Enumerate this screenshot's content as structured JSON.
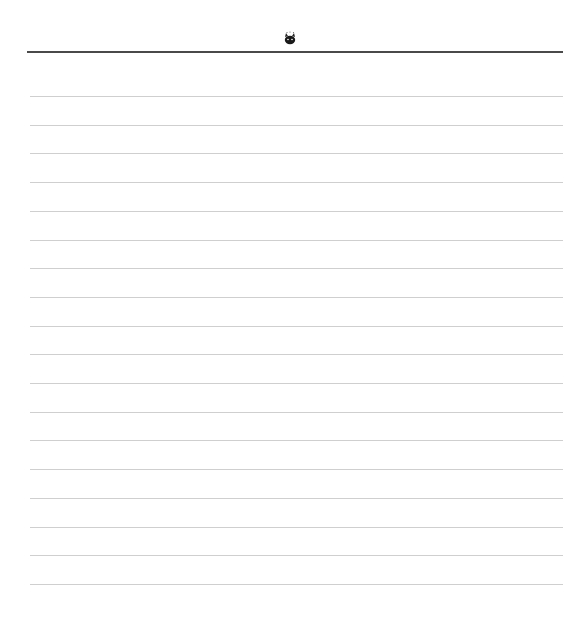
{
  "page": {
    "type": "lined-notepaper",
    "header": {
      "icon": "cat-face-icon",
      "rule_color": "#4a4a4a"
    },
    "ruled_lines": {
      "count": 18,
      "first_y": 96,
      "spacing": 28.7,
      "color": "#cfcfcf"
    }
  }
}
